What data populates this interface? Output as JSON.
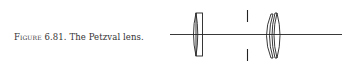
{
  "figure": {
    "label": "Figure",
    "number": "6.81.",
    "title": "The Petzval lens.",
    "diagram": {
      "description": "Petzval lens schematic: optical axis, front cemented lens, aperture stop, rear lens pair",
      "elements": [
        "optical-axis",
        "front-lens",
        "aperture-stop",
        "rear-lens-group"
      ]
    }
  }
}
